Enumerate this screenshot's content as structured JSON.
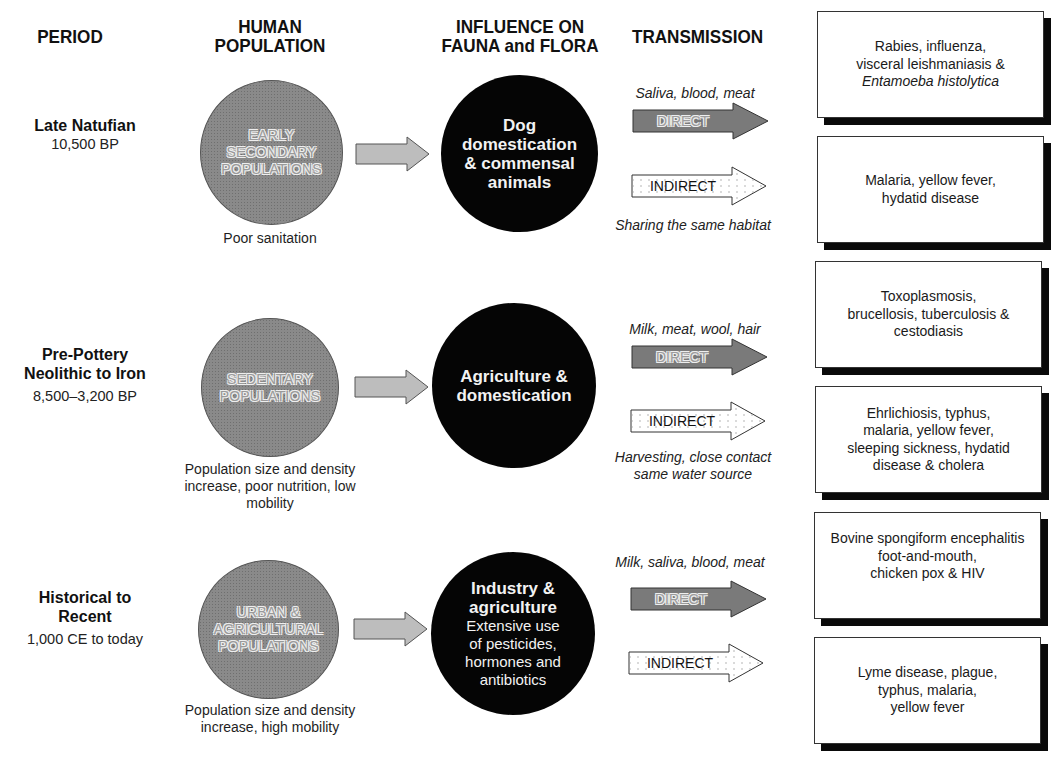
{
  "headers": {
    "period": "PERIOD",
    "human_population": "HUMAN\nPOPULATION",
    "influence": "INFLUENCE ON\nFAUNA and FLORA",
    "transmission": "TRANSMISSION"
  },
  "rows": [
    {
      "period_name": "Late Natufian",
      "period_dates": "10,500 BP",
      "population": "EARLY\nSECONDARY\nPOPULATIONS",
      "population_note": "Poor sanitation",
      "influence_title": "Dog\ndomestication\n& commensal\nanimals",
      "influence_sub": "",
      "direct_vector": "Saliva, blood, meat",
      "direct_label": "DIRECT",
      "indirect_label": "INDIRECT",
      "indirect_vector": "Sharing the same habitat",
      "direct_diseases": "Rabies, influenza,\nvisceral leishmaniasis &",
      "direct_diseases_italic": "Entamoeba histolytica",
      "indirect_diseases": "Malaria, yellow fever,\nhydatid disease"
    },
    {
      "period_name": "Pre-Pottery\nNeolithic to Iron",
      "period_dates": "8,500–3,200 BP",
      "population": "SEDENTARY\nPOPULATIONS",
      "population_note": "Population size and density\nincrease, poor nutrition, low\nmobility",
      "influence_title": "Agriculture &\ndomestication",
      "influence_sub": "",
      "direct_vector": "Milk, meat, wool, hair",
      "direct_label": "DIRECT",
      "indirect_label": "INDIRECT",
      "indirect_vector": "Harvesting, close contact\nsame water source",
      "direct_diseases": "Toxoplasmosis,\nbrucellosis, tuberculosis &\ncestodiasis",
      "direct_diseases_italic": "",
      "indirect_diseases": "Ehrlichiosis, typhus,\nmalaria, yellow fever,\nsleeping sickness, hydatid\ndisease & cholera"
    },
    {
      "period_name": "Historical to\nRecent",
      "period_dates": "1,000 CE to today",
      "population": "URBAN &\nAGRICULTURAL\nPOPULATIONS",
      "population_note": "Population size and density\nincrease, high mobility",
      "influence_title": "Industry &\nagriculture",
      "influence_sub": "Extensive use\nof pesticides,\nhormones and\nantibiotics",
      "direct_vector": "Milk, saliva, blood, meat",
      "direct_label": "DIRECT",
      "indirect_label": "INDIRECT",
      "indirect_vector": "",
      "direct_diseases": "Bovine spongiform encephalitis\nfoot-and-mouth,\nchicken pox & HIV",
      "direct_diseases_italic": "",
      "indirect_diseases": "Lyme disease, plague,\ntyphus, malaria,\nyellow fever"
    }
  ],
  "colors": {
    "population_circle": "#8a8a8a",
    "influence_circle": "#050505",
    "direct_arrow": "#7a7a7a",
    "indirect_arrow": "#ffffff",
    "flow_arrow": "#bdbdbd",
    "box_shadow": "#0a0a0a"
  }
}
